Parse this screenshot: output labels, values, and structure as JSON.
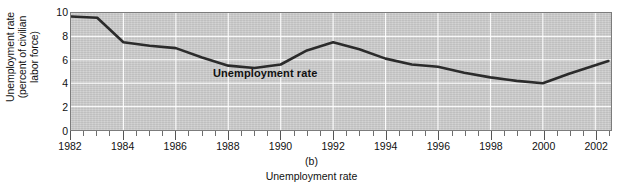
{
  "figure": {
    "panel_letter": "(b)",
    "caption": "Unemployment rate",
    "series_label": "Unemployment rate",
    "y_axis_title_lines": [
      "Unemployment",
      "(percent of civilian",
      "labor force)"
    ]
  },
  "colors": {
    "plot_background": "#cbcbcb",
    "gridline": "#ffffff",
    "line": "#2b2b2b",
    "frame": "#7c7c7c",
    "text": "#111111"
  },
  "chart_data": {
    "type": "line",
    "title": "",
    "xlabel": "Unemployment rate",
    "ylabel": "Unemployment (percent of civilian labor force)",
    "xlim": [
      1982,
      2002.6
    ],
    "ylim": [
      0,
      10
    ],
    "grid": true,
    "legend_position": "inline-annotation",
    "y_ticks": [
      0,
      2,
      4,
      6,
      8,
      10
    ],
    "y_tick_labels": [
      "0",
      "2",
      "4",
      "6",
      "8",
      "10"
    ],
    "x_ticks": [
      1982,
      1984,
      1986,
      1988,
      1990,
      1992,
      1994,
      1996,
      1998,
      2000,
      2002
    ],
    "x_tick_labels": [
      "1982",
      "1984",
      "1986",
      "1988",
      "1990",
      "1992",
      "1994",
      "1996",
      "1998",
      "2000",
      "2002"
    ],
    "x_minor_ticks_per_interval": 4,
    "series": [
      {
        "name": "Unemployment rate",
        "x": [
          1982,
          1983,
          1984,
          1985,
          1986,
          1987,
          1988,
          1989,
          1990,
          1991,
          1992,
          1993,
          1994,
          1995,
          1996,
          1997,
          1998,
          1999,
          2000,
          2001,
          2002.5
        ],
        "values": [
          9.7,
          9.6,
          7.5,
          7.2,
          7.0,
          6.2,
          5.5,
          5.3,
          5.6,
          6.8,
          7.5,
          6.9,
          6.1,
          5.6,
          5.4,
          4.9,
          4.5,
          4.2,
          4.0,
          4.8,
          5.9
        ]
      }
    ]
  }
}
